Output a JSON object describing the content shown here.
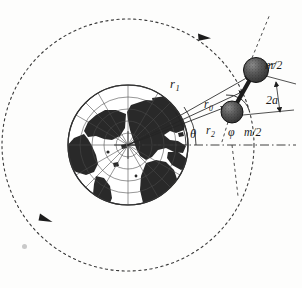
{
  "figure": {
    "labels": {
      "r1": {
        "base": "r",
        "sub": "1",
        "name": "vector-r1"
      },
      "r0": {
        "base": "r",
        "sub": "0",
        "name": "vector-r0"
      },
      "r2": {
        "base": "r",
        "sub": "2",
        "name": "vector-r2"
      },
      "theta": {
        "base": "θ",
        "name": "angle-theta"
      },
      "phi": {
        "base": "φ",
        "name": "angle-phi"
      },
      "mass_upper": {
        "base": "m/2",
        "name": "mass-upper"
      },
      "mass_lower": {
        "base": "m/2",
        "name": "mass-lower"
      },
      "separation": {
        "base": "2a",
        "name": "separation-2a"
      }
    },
    "colors": {
      "ink": "#1a1a1a",
      "line": "#2a2a2a",
      "orbit": "#3a3a3a",
      "land": "#2b2b2b",
      "graticule": "#444444",
      "mass_fill": "#4a4a4a",
      "mass_stroke": "#111111",
      "speck": "#c9c9c9",
      "background": "#fdfdfc"
    },
    "geometry": {
      "earth_center": {
        "x": 128,
        "y": 145
      },
      "earth_radius": 60,
      "orbit_radius": 126,
      "inner_orbit_radius": 126,
      "mass_upper_center": {
        "x": 256,
        "y": 70
      },
      "mass_upper_radius": 12.5,
      "mass_lower_center": {
        "x": 232,
        "y": 112
      },
      "mass_lower_radius": 11,
      "orbit_arrow_top": {
        "x": 205,
        "y": 36
      },
      "orbit_arrow_lower_left": {
        "x": 45,
        "y": 219
      }
    },
    "elements": {
      "earth": "polar-projection globe with graticule",
      "orbit": "dashed circular orbit with two direction arrowheads",
      "dumbbell": "two spheres joined by a rigid rod",
      "reference_line": "horizontal dash-dot datum line through Earth centre",
      "body_axis": "dashed line along the dumbbell axis"
    }
  }
}
